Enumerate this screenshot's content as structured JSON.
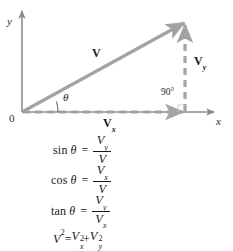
{
  "figure": {
    "kind": "vector-components-diagram",
    "caption": ""
  },
  "diagram": {
    "axes": {
      "x_label": "x",
      "y_label": "y",
      "origin_label": "0",
      "x_axis_from": [
        22,
        112
      ],
      "x_axis_to": [
        215,
        112
      ],
      "y_axis_from": [
        22,
        112
      ],
      "y_axis_to": [
        22,
        10
      ]
    },
    "vectors": [
      {
        "name": "resultant-vector",
        "label": "V",
        "subscript": "",
        "style": "solid",
        "color": "#a3a3a3",
        "from": [
          22,
          112
        ],
        "to": [
          185,
          22
        ]
      },
      {
        "name": "x-component-vector",
        "label": "V",
        "subscript": "x",
        "style": "dashed",
        "color": "#a3a3a3",
        "from": [
          22,
          112
        ],
        "to": [
          185,
          112
        ]
      },
      {
        "name": "y-component-vector",
        "label": "V",
        "subscript": "y",
        "style": "dashed",
        "color": "#a3a3a3",
        "from": [
          185,
          112
        ],
        "to": [
          185,
          22
        ]
      }
    ],
    "angles": [
      {
        "name": "theta-angle",
        "label": "θ",
        "at": [
          62,
          96
        ]
      },
      {
        "name": "right-angle",
        "label": "90°",
        "at": [
          164,
          91
        ]
      }
    ],
    "labels": {
      "v_label": "V",
      "vx_label": "V",
      "vx_sub": "x",
      "vy_label": "V",
      "vy_sub": "y",
      "theta": "θ",
      "right_angle": "90°",
      "x_axis": "x",
      "y_axis": "y",
      "origin": "0"
    },
    "colors": {
      "vector": "#a3a3a3",
      "axis": "#8c8c8c",
      "text": "#1a1a1a"
    }
  },
  "equations": [
    {
      "id": "sine-equation",
      "fn": "sin",
      "theta": "θ",
      "equals": "=",
      "numerator": "V",
      "numerator_sub": "y",
      "denominator": "V",
      "denominator_sub": "",
      "plain": "sin θ = V_y / V"
    },
    {
      "id": "cosine-equation",
      "fn": "cos",
      "theta": "θ",
      "equals": "=",
      "numerator": "V",
      "numerator_sub": "x",
      "denominator": "V",
      "denominator_sub": "",
      "plain": "cos θ = V_x / V"
    },
    {
      "id": "tangent-equation",
      "fn": "tan",
      "theta": "θ",
      "equals": "=",
      "numerator": "V",
      "numerator_sub": "y",
      "denominator": "V",
      "denominator_sub": "x",
      "plain": "tan θ = V_y / V_x"
    }
  ],
  "pythagorean": {
    "id": "pythagorean-equation",
    "lhs_var": "V",
    "lhs_exp": "2",
    "equals": "=",
    "term1_var": "V",
    "term1_sub": "x",
    "term1_exp": "2",
    "plus": "+",
    "term2_var": "V",
    "term2_sub": "y",
    "term2_exp": "2",
    "plain": "V² = Vₓ² + Vᵧ²"
  }
}
